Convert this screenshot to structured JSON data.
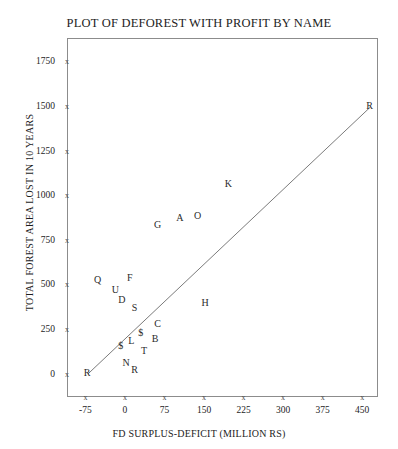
{
  "chart_data": {
    "type": "scatter",
    "title": "PLOT OF DEFOREST WITH PROFIT BY NAME",
    "xlabel": "FD SURPLUS-DEFICIT (MILLION RS)",
    "ylabel": "TOTAL FOREST AREA LOST IN 10 YEARS",
    "xlim": [
      -110,
      480
    ],
    "ylim": [
      -130,
      1880
    ],
    "grid": false,
    "legend": null,
    "marker_style": "letter-label",
    "xticks": [
      -75,
      0,
      75,
      150,
      225,
      300,
      375,
      450
    ],
    "xticklabels": [
      "-75",
      "0",
      "75",
      "150",
      "225",
      "300",
      "375",
      "450"
    ],
    "yticks": [
      0,
      250,
      500,
      750,
      1000,
      1250,
      1500,
      1750
    ],
    "yticklabels": [
      "0",
      "250",
      "500",
      "750",
      "1000",
      "1250",
      "1500",
      "1750"
    ],
    "tick_glyph": "x",
    "points": [
      {
        "label": "R",
        "x": -72,
        "y": 5
      },
      {
        "label": "Q",
        "x": -52,
        "y": 525
      },
      {
        "label": "U",
        "x": -18,
        "y": 470
      },
      {
        "label": "D",
        "x": -6,
        "y": 415
      },
      {
        "label": "F",
        "x": 9,
        "y": 535
      },
      {
        "label": "S",
        "x": 18,
        "y": 370
      },
      {
        "label": "$",
        "x": -8,
        "y": 155
      },
      {
        "label": "N",
        "x": 2,
        "y": 60
      },
      {
        "label": "L",
        "x": 12,
        "y": 185
      },
      {
        "label": "R",
        "x": 18,
        "y": 20
      },
      {
        "label": "$",
        "x": 30,
        "y": 230
      },
      {
        "label": "T",
        "x": 36,
        "y": 130
      },
      {
        "label": "B",
        "x": 57,
        "y": 195
      },
      {
        "label": "C",
        "x": 62,
        "y": 280
      },
      {
        "label": "G",
        "x": 62,
        "y": 835
      },
      {
        "label": "A",
        "x": 104,
        "y": 870
      },
      {
        "label": "O",
        "x": 138,
        "y": 885
      },
      {
        "label": "H",
        "x": 152,
        "y": 395
      },
      {
        "label": "K",
        "x": 196,
        "y": 1065
      },
      {
        "label": "R",
        "x": 464,
        "y": 1500
      }
    ],
    "fit_line": {
      "type": "linear",
      "x_start": -72,
      "y_start": 5,
      "x_end": 464,
      "y_end": 1500
    }
  },
  "colors": {
    "background": "#ffffff",
    "frame": "#8c8c8c",
    "text": "#1d1d1d",
    "point_text": "#2b2b2b",
    "line": "#7b7b7b"
  }
}
